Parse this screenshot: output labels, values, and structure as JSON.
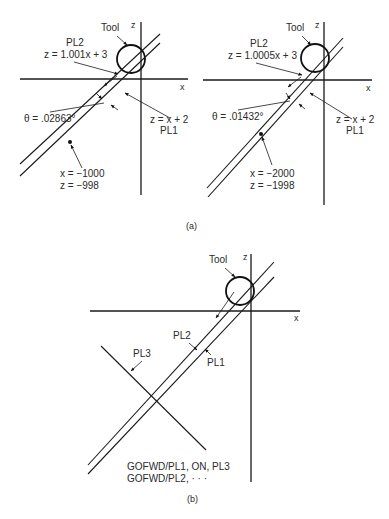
{
  "figure": {
    "panel_a": {
      "caption": "(a)",
      "left": {
        "axis_x": "x",
        "axis_z": "z",
        "tool_label": "Tool",
        "pl2_name": "PL2",
        "pl2_equation": "z = 1.001x + 3",
        "pl1_equation": "z = x + 2",
        "pl1_name": "PL1",
        "theta": "θ = .02863°",
        "intersection_x": "x = −1000",
        "intersection_z": "z = −998"
      },
      "right": {
        "axis_x": "x",
        "axis_z": "z",
        "tool_label": "Tool",
        "pl2_name": "PL2",
        "pl2_equation": "z = 1.0005x + 3",
        "pl1_equation": "z = x + 2",
        "pl1_name": "PL1",
        "theta": "θ = .01432°",
        "intersection_x": "x = −2000",
        "intersection_z": "z = −1998"
      }
    },
    "panel_b": {
      "caption": "(b)",
      "axis_x": "x",
      "axis_z": "z",
      "tool_label": "Tool",
      "pl2_name": "PL2",
      "pl1_name": "PL1",
      "pl3_name": "PL3",
      "command_1": "GOFWD/PL1, ON, PL3",
      "command_2": "GOFWD/PL2, · · ·"
    }
  }
}
